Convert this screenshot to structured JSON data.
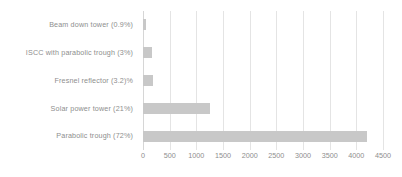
{
  "chart_data": {
    "type": "bar",
    "orientation": "horizontal",
    "title": "",
    "xlabel": "",
    "ylabel": "",
    "categories": [
      "Beam down tower (0.9%)",
      "ISCC with parabolic trough (3%)",
      "Fresnel reflector (3.2)%",
      "Solar power tower (21%)",
      "Parabolic trough (72%)"
    ],
    "values": [
      50,
      175,
      185,
      1250,
      4200
    ],
    "shares_percent": [
      0.9,
      3,
      3.2,
      21,
      72
    ],
    "xlim": [
      0,
      4500
    ],
    "xticks": [
      0,
      500,
      1000,
      1500,
      2000,
      2500,
      3000,
      3500,
      4000,
      4500
    ],
    "xtick_labels": [
      "0",
      "500",
      "1000",
      "1500",
      "2000",
      "2500",
      "3000",
      "3500",
      "4000",
      "4500"
    ],
    "grid": true,
    "grid_axis": "x",
    "legend": false,
    "bar_color": "#c8c8c8",
    "gridline_color": "#e4e4e4",
    "text_color": "#8e8e8e",
    "background_color": "#ffffff"
  }
}
